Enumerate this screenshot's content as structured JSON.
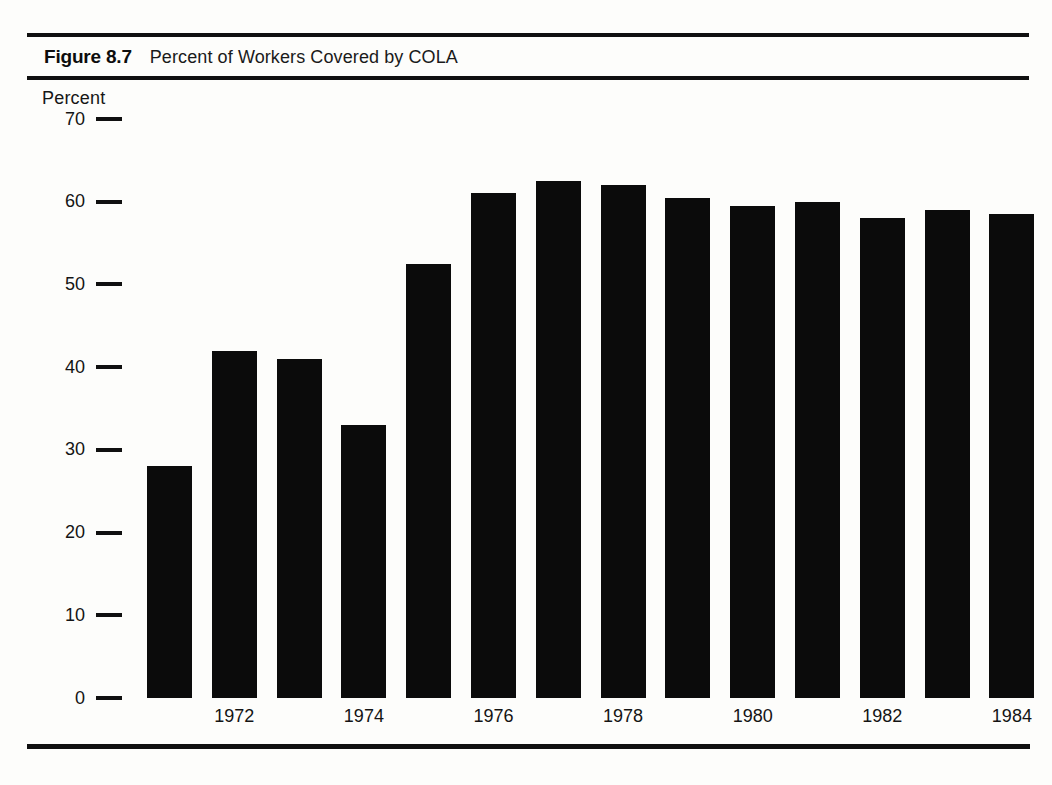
{
  "figure": {
    "number": "Figure 8.7",
    "caption": "Percent of Workers Covered by COLA"
  },
  "axis": {
    "y_title": "Percent"
  },
  "colors": {
    "bar": "#0b0b0b",
    "rule": "#101010",
    "text": "#141414",
    "background": "#fdfdfb"
  },
  "chart_data": {
    "type": "bar",
    "title": "Percent of Workers Covered by COLA",
    "xlabel": "",
    "ylabel": "Percent",
    "ylim": [
      0,
      70
    ],
    "yticks": [
      0,
      10,
      20,
      30,
      40,
      50,
      60,
      70
    ],
    "grid": false,
    "legend": null,
    "categories": [
      1971,
      1972,
      1973,
      1974,
      1975,
      1976,
      1977,
      1978,
      1979,
      1980,
      1981,
      1982,
      1983,
      1984
    ],
    "visible_tick_labels": [
      "1972",
      "1974",
      "1976",
      "1978",
      "1980",
      "1982",
      "1984"
    ],
    "values": [
      28.0,
      42.0,
      41.0,
      33.0,
      52.5,
      61.0,
      62.5,
      62.0,
      60.5,
      59.5,
      60.0,
      58.0,
      59.0,
      58.5
    ]
  }
}
